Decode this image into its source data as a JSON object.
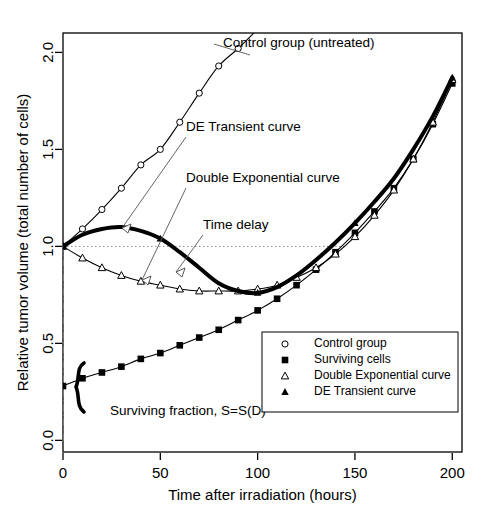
{
  "chart_data": {
    "type": "line",
    "title": "",
    "xlabel": "Time after irradiation (hours)",
    "ylabel": "Relative tumor volume (total number of cells)",
    "xlim": [
      0,
      205
    ],
    "ylim": [
      -0.06,
      2.1
    ],
    "xticks": [
      0,
      50,
      100,
      150,
      200
    ],
    "xticklabels": [
      "0",
      "50",
      "100",
      "150",
      "200"
    ],
    "yticks": [
      0.0,
      0.5,
      1.0,
      1.5,
      2.0
    ],
    "yticklabels": [
      "0.0",
      "0.5",
      "1.0",
      "1.5",
      "2.0"
    ],
    "grid": false,
    "legend_position": "lower-right-inside",
    "series": [
      {
        "name": "Control group",
        "marker": "open-circle",
        "color": "#000000",
        "x": [
          0,
          10,
          20,
          30,
          40,
          50,
          60,
          70,
          80,
          90,
          100
        ],
        "values": [
          1.0,
          1.09,
          1.19,
          1.3,
          1.42,
          1.5,
          1.64,
          1.79,
          1.93,
          2.02,
          2.12
        ]
      },
      {
        "name": "Surviving cells",
        "marker": "filled-square",
        "color": "#000000",
        "x": [
          0,
          10,
          20,
          30,
          40,
          50,
          60,
          70,
          80,
          90,
          100,
          110,
          120,
          130,
          140,
          150,
          160,
          170,
          180,
          190,
          200
        ],
        "values": [
          0.28,
          0.32,
          0.35,
          0.38,
          0.42,
          0.45,
          0.49,
          0.53,
          0.57,
          0.62,
          0.67,
          0.73,
          0.8,
          0.88,
          0.97,
          1.07,
          1.18,
          1.3,
          1.45,
          1.63,
          1.84
        ]
      },
      {
        "name": "Double Exponential curve",
        "marker": "open-triangle",
        "color": "#000000",
        "x": [
          0,
          10,
          20,
          30,
          40,
          50,
          60,
          70,
          80,
          90,
          100,
          110,
          120,
          130,
          140,
          150,
          160,
          170,
          180,
          190,
          200
        ],
        "values": [
          1.0,
          0.94,
          0.89,
          0.85,
          0.82,
          0.8,
          0.78,
          0.77,
          0.77,
          0.77,
          0.78,
          0.8,
          0.84,
          0.89,
          0.96,
          1.05,
          1.16,
          1.29,
          1.45,
          1.64,
          1.86
        ]
      },
      {
        "name": "DE Transient curve",
        "marker": "filled-triangle",
        "color": "#000000",
        "x": [
          0,
          10,
          20,
          30,
          40,
          50,
          60,
          70,
          80,
          90,
          100,
          110,
          120,
          130,
          140,
          150,
          160,
          170,
          180,
          190,
          200
        ],
        "values": [
          1.0,
          1.06,
          1.09,
          1.1,
          1.08,
          1.04,
          0.97,
          0.89,
          0.81,
          0.77,
          0.76,
          0.79,
          0.85,
          0.93,
          1.02,
          1.12,
          1.23,
          1.35,
          1.5,
          1.67,
          1.87
        ]
      }
    ],
    "reference_lines": [
      {
        "name": "time-delay-line",
        "orientation": "horizontal",
        "value": 1.0,
        "x_start": 0,
        "x_end": 146,
        "style": "dotted"
      },
      {
        "name": "dose-line",
        "orientation": "vertical",
        "value": 0,
        "y_start": 0.0,
        "y_end": 1.0,
        "style": "dash-dot"
      }
    ],
    "annotations": [
      {
        "name": "control-group-annotation",
        "text": "Control group (untreated)",
        "x": 223,
        "y": 47
      },
      {
        "name": "de-transient-annotation",
        "text": "DE Transient curve",
        "x": 186,
        "y": 131
      },
      {
        "name": "double-exponential-annotation",
        "text": "Double Exponential curve",
        "x": 186,
        "y": 182
      },
      {
        "name": "time-delay-annotation",
        "text": "Time delay",
        "x": 203,
        "y": 229
      },
      {
        "name": "surviving-fraction-annotation",
        "text": "Surviving fraction, S=S(D)",
        "x": 110,
        "y": 415
      }
    ]
  },
  "legend": {
    "items": [
      {
        "label": "Control group",
        "marker": "open-circle"
      },
      {
        "label": "Surviving cells",
        "marker": "filled-square"
      },
      {
        "label": "Double Exponential curve",
        "marker": "open-triangle"
      },
      {
        "label": "DE Transient curve",
        "marker": "filled-triangle"
      }
    ]
  }
}
